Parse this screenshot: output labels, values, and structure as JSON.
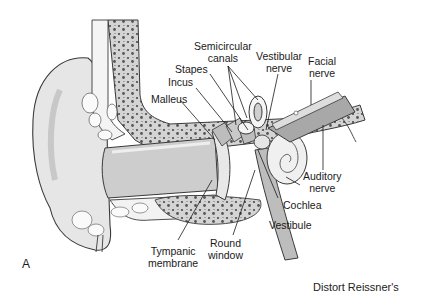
{
  "figure": {
    "panel_letter": "A",
    "caption_fragment": "Distort Reissner's",
    "colors": {
      "background": "#ffffff",
      "outline": "#3a3a3a",
      "skin": "#e4e4e4",
      "canal": "#cfcfcf",
      "bone": "#d2d2d2",
      "bone_dots": "#4a4a4a",
      "nerve": "#a8a8a8",
      "cochlea": "#f0f0f0"
    },
    "labels": {
      "semicircular_canals": "Semicircular\ncanals",
      "stapes": "Stapes",
      "incus": "Incus",
      "malleus": "Malleus",
      "vestibular_nerve": "Vestibular\nnerve",
      "facial_nerve": "Facial\nnerve",
      "auditory_nerve": "Auditory\nnerve",
      "cochlea": "Cochlea",
      "vestibule": "Vestibule",
      "round_window": "Round\nwindow",
      "tympanic_membrane": "Tympanic\nmembrane"
    }
  }
}
